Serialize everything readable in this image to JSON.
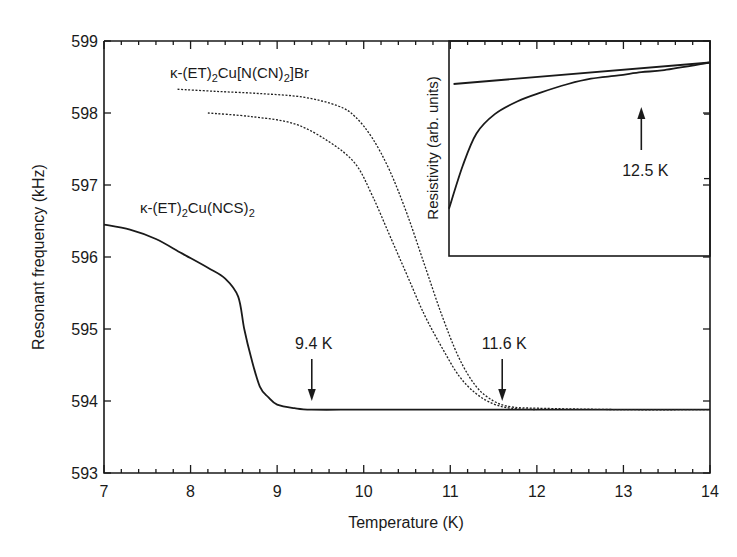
{
  "chart_data": {
    "type": "line",
    "title": "",
    "xlabel": "Temperature (K)",
    "ylabel": "Resonant frequency (kHz)",
    "xlim": [
      7,
      14
    ],
    "ylim": [
      593,
      599
    ],
    "x_ticks": [
      7,
      8,
      9,
      10,
      11,
      12,
      13,
      14
    ],
    "y_ticks": [
      593,
      594,
      595,
      596,
      597,
      598,
      599
    ],
    "grid": false,
    "legend": "none (curves labeled directly)",
    "series": [
      {
        "name": "κ-(ET)2Cu(NCS)2",
        "style": "solid",
        "x": [
          7.0,
          7.3,
          7.6,
          7.9,
          8.2,
          8.4,
          8.55,
          8.62,
          8.7,
          8.8,
          8.9,
          9.0,
          9.2,
          9.4,
          10.0,
          11.0,
          12.0,
          13.0,
          14.0
        ],
        "y": [
          596.45,
          596.38,
          596.25,
          596.05,
          595.85,
          595.7,
          595.45,
          595.0,
          594.6,
          594.2,
          594.05,
          593.95,
          593.9,
          593.88,
          593.88,
          593.88,
          593.88,
          593.88,
          593.88
        ]
      },
      {
        "name": "κ-(ET)2Cu[N(CN)2]Br (upper sweep)",
        "style": "dotted",
        "x": [
          7.85,
          8.3,
          8.8,
          9.3,
          9.7,
          9.9,
          10.1,
          10.3,
          10.5,
          10.7,
          10.9,
          11.1,
          11.3,
          11.5,
          11.7,
          12.0,
          13.0,
          14.0
        ],
        "y": [
          598.33,
          598.3,
          598.27,
          598.22,
          598.1,
          597.95,
          597.65,
          597.2,
          596.6,
          595.9,
          595.2,
          594.6,
          594.2,
          594.0,
          593.92,
          593.9,
          593.88,
          593.88
        ]
      },
      {
        "name": "κ-(ET)2Cu[N(CN)2]Br (lower sweep)",
        "style": "dotted",
        "x": [
          8.2,
          8.7,
          9.2,
          9.6,
          9.9,
          10.1,
          10.3,
          10.5,
          10.7,
          10.9,
          11.1,
          11.3,
          11.5,
          11.7,
          12.0
        ],
        "y": [
          598.0,
          597.95,
          597.85,
          597.6,
          597.3,
          596.85,
          596.3,
          595.75,
          595.2,
          594.75,
          594.35,
          594.1,
          593.96,
          593.9,
          593.88
        ]
      }
    ],
    "annotations": [
      {
        "text": "9.4 K",
        "type": "down-arrow",
        "x": 9.4,
        "y": 593.9
      },
      {
        "text": "11.6 K",
        "type": "down-arrow",
        "x": 11.6,
        "y": 593.9
      },
      {
        "text": "κ-(ET)2Cu[N(CN)2]Br",
        "type": "label",
        "x": 8.8,
        "y": 598.5
      },
      {
        "text": "κ-(ET)2Cu(NCS)2",
        "type": "label",
        "x": 8.2,
        "y": 596.7
      }
    ],
    "inset": {
      "type": "line",
      "ylabel": "Resistivity (arb. units)",
      "xlim": [
        8.3,
        14
      ],
      "ylim_normalized": [
        0,
        1
      ],
      "note": "y-axis has no numeric scale; values are normalized to inset height",
      "series": [
        {
          "name": "resistivity",
          "style": "solid",
          "x": [
            8.3,
            8.6,
            8.9,
            9.3,
            9.8,
            10.3,
            10.9,
            11.4,
            12.0,
            12.5,
            13.0,
            14.0
          ],
          "y": [
            0.22,
            0.42,
            0.57,
            0.66,
            0.72,
            0.76,
            0.8,
            0.825,
            0.84,
            0.855,
            0.865,
            0.9
          ]
        },
        {
          "name": "normal-state extrapolation",
          "style": "solid",
          "x": [
            8.4,
            14.0
          ],
          "y": [
            0.8,
            0.9
          ]
        }
      ],
      "annotations": [
        {
          "text": "12.5 K",
          "type": "up-arrow",
          "x": 12.5,
          "y": 0.855
        }
      ]
    }
  },
  "labels": {
    "xlabel": "Temperature (K)",
    "ylabel": "Resonant frequency (kHz)",
    "series_br_label_prefix": "κ-(ET)",
    "series_br_label_mid": "Cu[N(CN)",
    "series_br_label_suffix": "]Br",
    "series_ncs_label_prefix": "κ-(ET)",
    "series_ncs_label_mid": "Cu(NCS)",
    "subscript_2": "2",
    "annot_94": "9.4 K",
    "annot_116": "11.6 K",
    "annot_125": "12.5 K",
    "inset_ylabel": "Resistivity (arb. units)"
  },
  "colors": {
    "ink": "#1a1a1a",
    "background": "#ffffff"
  }
}
